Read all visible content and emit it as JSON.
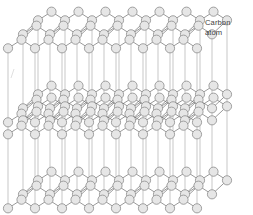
{
  "figure": {
    "type": "molecular-lattice-diagram",
    "width": 253,
    "height": 215,
    "background_color": "#ffffff"
  },
  "annotations": {
    "carbon_label": {
      "line1": "Carbon",
      "line2": "atom",
      "color": "#3d3d3d",
      "x": 205,
      "y": 18
    }
  },
  "style": {
    "atom_fill": "#e6e6e6",
    "atom_stroke": "#8c8c8c",
    "atom_radius": 4.6,
    "bond_stroke": "#6e6e6e",
    "bond_width": 0.7,
    "pillar_stroke": "#b0b0b0",
    "pillar_width": 0.7,
    "artifact_stroke": "#dcdcdc"
  },
  "lattice": {
    "description": "Four stacked hexagonal carbon sheets connected by vertical interlayer pillars",
    "sheet_count": 4,
    "sheets": [
      {
        "name": "sheet-top",
        "y_front": 44,
        "y_back": 16,
        "x_shift": 30
      },
      {
        "name": "sheet-upper-mid",
        "y_front": 118,
        "y_back": 90,
        "x_shift": 30
      },
      {
        "name": "sheet-lower-mid",
        "y_front": 130,
        "y_back": 102,
        "x_shift": 30
      },
      {
        "name": "sheet-bottom",
        "y_front": 204,
        "y_back": 176,
        "x_shift": 30
      }
    ],
    "geometry": {
      "cell_width": 27,
      "zigzag_amplitude": 9,
      "row_gap": 14,
      "columns": 7,
      "rows_per_sheet": 3,
      "origin_x": 8,
      "depth_dx": 30,
      "depth_dy": -28
    },
    "pillar_count": 24
  }
}
